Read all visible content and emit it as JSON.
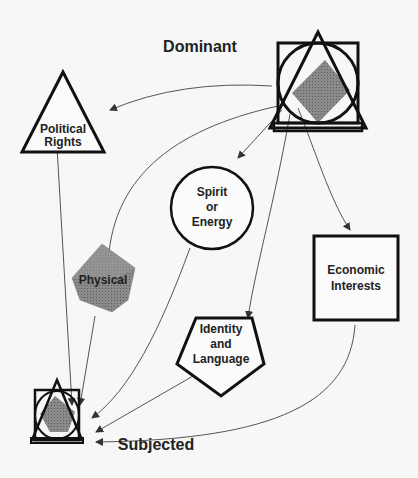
{
  "diagram": {
    "colors": {
      "stroke": "#111111",
      "background": "#f7f7f7",
      "shape_fill": "#808080",
      "arrow": "#555555"
    },
    "labels": {
      "dominant": "Dominant",
      "subjected": "Subjected"
    },
    "nodes": [
      {
        "id": "political",
        "shape": "triangle",
        "lines": [
          "Political",
          "Rights"
        ]
      },
      {
        "id": "spirit",
        "shape": "circle",
        "lines": [
          "Spirit",
          "or",
          "Energy"
        ]
      },
      {
        "id": "physical",
        "shape": "cube",
        "lines": [
          "Physical"
        ]
      },
      {
        "id": "economic",
        "shape": "square",
        "lines": [
          "Economic",
          "Interests"
        ]
      },
      {
        "id": "identity",
        "shape": "pentagon",
        "lines": [
          "Identity",
          "and",
          "Language"
        ]
      }
    ],
    "edges": [
      [
        "dominant",
        "political"
      ],
      [
        "dominant",
        "spirit"
      ],
      [
        "dominant",
        "physical"
      ],
      [
        "dominant",
        "economic"
      ],
      [
        "dominant",
        "identity"
      ],
      [
        "political",
        "subjected"
      ],
      [
        "spirit",
        "subjected"
      ],
      [
        "physical",
        "subjected"
      ],
      [
        "economic",
        "subjected"
      ],
      [
        "identity",
        "subjected"
      ]
    ]
  }
}
